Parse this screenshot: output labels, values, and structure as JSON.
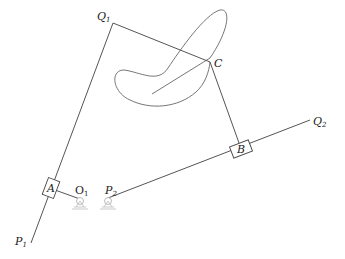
{
  "diagram": {
    "type": "planar mechanism (linkage with sliders)",
    "labels": {
      "Q1": {
        "main": "Q",
        "sub": "1"
      },
      "Q2": {
        "main": "Q",
        "sub": "2"
      },
      "P1": {
        "main": "P",
        "sub": "1"
      },
      "P2": {
        "main": "P",
        "sub": "2"
      },
      "O1": {
        "main": "O",
        "sub": "1"
      },
      "A": "A",
      "B": "B",
      "C": "C"
    },
    "colors": {
      "line": "#555555",
      "curve": "#666666",
      "pivot": "#aaaaaa",
      "background": "#ffffff"
    }
  }
}
